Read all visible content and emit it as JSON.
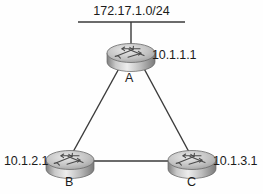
{
  "diagram": {
    "type": "network-topology",
    "lan": {
      "name": "172.17.1.0/24",
      "icon": "ethernet-segment-icon"
    },
    "routers": [
      {
        "id": "A",
        "letter": "A",
        "ip": "10.1.1.1",
        "icon": "router-icon"
      },
      {
        "id": "B",
        "letter": "B",
        "ip": "10.1.2.1",
        "icon": "router-icon"
      },
      {
        "id": "C",
        "letter": "C",
        "ip": "10.1.3.1",
        "icon": "router-icon"
      }
    ],
    "links": [
      {
        "from": "LAN",
        "to": "A",
        "style": "solid"
      },
      {
        "from": "A",
        "to": "B",
        "style": "solid"
      },
      {
        "from": "A",
        "to": "C",
        "style": "solid"
      },
      {
        "from": "B",
        "to": "C",
        "style": "solid"
      }
    ],
    "colors": {
      "line": "#3a3a3a",
      "text": "#1b1b1b",
      "router_body_light": "#e6e6e6",
      "router_body_dark": "#8d8d8d",
      "background": "#fefefe"
    }
  }
}
